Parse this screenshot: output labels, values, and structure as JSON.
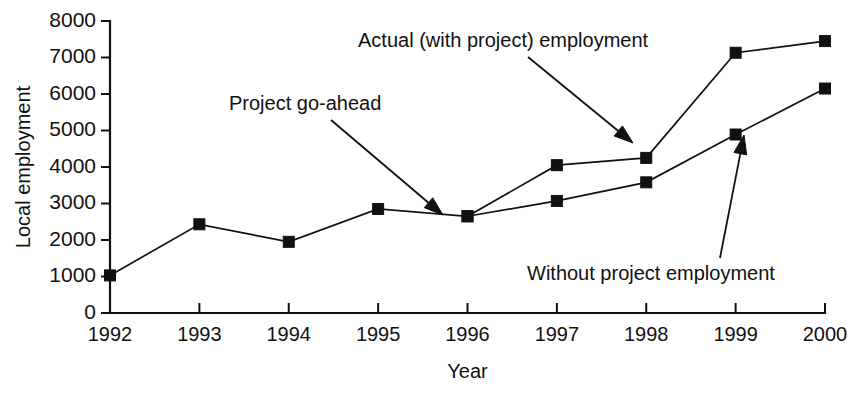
{
  "chart_data": {
    "type": "line",
    "title": "",
    "xlabel": "Year",
    "ylabel": "Local employment",
    "categories": [
      "1992",
      "1993",
      "1994",
      "1995",
      "1996",
      "1997",
      "1998",
      "1999",
      "2000"
    ],
    "x": [
      1992,
      1993,
      1994,
      1995,
      1996,
      1997,
      1998,
      1999,
      2000
    ],
    "ylim": [
      0,
      8000
    ],
    "xlim": [
      1992,
      2000
    ],
    "ytick_labels": [
      "0",
      "1000",
      "2000",
      "3000",
      "4000",
      "5000",
      "6000",
      "7000",
      "8000"
    ],
    "yticks": [
      0,
      1000,
      2000,
      3000,
      4000,
      5000,
      6000,
      7000,
      8000
    ],
    "grid": false,
    "legend": "none",
    "marker": "filled-square",
    "series": [
      {
        "name": "Actual (with project) employment",
        "x": [
          1992,
          1993,
          1994,
          1995,
          1996,
          1997,
          1998,
          1999,
          2000
        ],
        "values": [
          1030,
          2430,
          1950,
          2850,
          2650,
          4050,
          4250,
          7130,
          7450
        ]
      },
      {
        "name": "Without project employment",
        "x": [
          1996,
          1997,
          1998,
          1999,
          2000
        ],
        "values": [
          2650,
          3070,
          3580,
          4890,
          6150
        ]
      }
    ],
    "annotations": [
      {
        "id": "actual-with-project",
        "text": "Actual (with project) employment",
        "text_x": 358,
        "text_y": 47,
        "arrow_from_x": 528,
        "arrow_from_y": 57,
        "arrow_to_x": 633,
        "arrow_to_y": 143
      },
      {
        "id": "project-go-ahead",
        "text": "Project go-ahead",
        "text_x": 229,
        "text_y": 110,
        "arrow_from_x": 331,
        "arrow_from_y": 120,
        "arrow_to_x": 443,
        "arrow_to_y": 215
      },
      {
        "id": "without-project",
        "text": "Without project employment",
        "text_x": 527,
        "text_y": 280,
        "arrow_from_x": 720,
        "arrow_from_y": 258,
        "arrow_to_x": 744,
        "arrow_to_y": 135
      }
    ],
    "colors": {
      "line": "#111111",
      "marker": "#111111",
      "axis": "#111111",
      "background": "#ffffff"
    }
  }
}
